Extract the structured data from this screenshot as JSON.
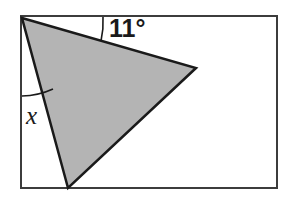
{
  "figure": {
    "type": "geometry-diagram",
    "canvas": {
      "width": 286,
      "height": 199,
      "background": "#ffffff"
    },
    "rectangle": {
      "name": "bounding-rectangle",
      "x": 21,
      "y": 16,
      "width": 256,
      "height": 172,
      "stroke": "#3c3c3c",
      "stroke_width": 2,
      "fill": "#ffffff"
    },
    "triangle": {
      "name": "shaded-triangle",
      "points": "22,18 196,68 68,188",
      "vertices": [
        {
          "name": "apex-top-left",
          "x": 22,
          "y": 18
        },
        {
          "name": "vertex-right",
          "x": 196,
          "y": 68
        },
        {
          "name": "vertex-bottom",
          "x": 68,
          "y": 188
        }
      ],
      "fill": "#b4b4b4",
      "stroke": "#1a1a1a",
      "stroke_width": 2.5
    },
    "angles": [
      {
        "name": "angle-11-degrees",
        "label": "11°",
        "value": 11,
        "unit": "degrees",
        "at_vertex": "apex-top-left",
        "between": [
          "rectangle-top-edge",
          "triangle-upper-edge"
        ],
        "arc_path": "M 103 17 A 86 86 0 0 1 101 41",
        "label_x": 109,
        "label_y": 37
      },
      {
        "name": "angle-x-unknown",
        "label": "x",
        "value": null,
        "unit": "degrees",
        "at_vertex": "apex-top-left",
        "between": [
          "rectangle-left-edge",
          "triangle-left-edge"
        ],
        "arc_path": "M 22 96 A 78 78 0 0 0 53 89",
        "label_x": 26,
        "label_y": 124
      }
    ],
    "colors": {
      "shade_fill": "#b4b4b4",
      "outline": "#1a1a1a",
      "frame": "#3c3c3c",
      "background": "#ffffff"
    }
  }
}
